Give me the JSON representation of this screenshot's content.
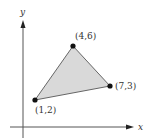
{
  "figure": {
    "type": "triangle-on-coordinate-plane",
    "axes": {
      "x_label": "x",
      "y_label": "y"
    },
    "vertices": [
      {
        "label": "(4,6)",
        "x": 4,
        "y": 6
      },
      {
        "label": "(7,3)",
        "x": 7,
        "y": 3
      },
      {
        "label": "(1,2)",
        "x": 1,
        "y": 2
      }
    ],
    "colors": {
      "fill": "#d9d9d9",
      "edge": "#555555",
      "axis": "#555555",
      "point": "#111111"
    }
  }
}
